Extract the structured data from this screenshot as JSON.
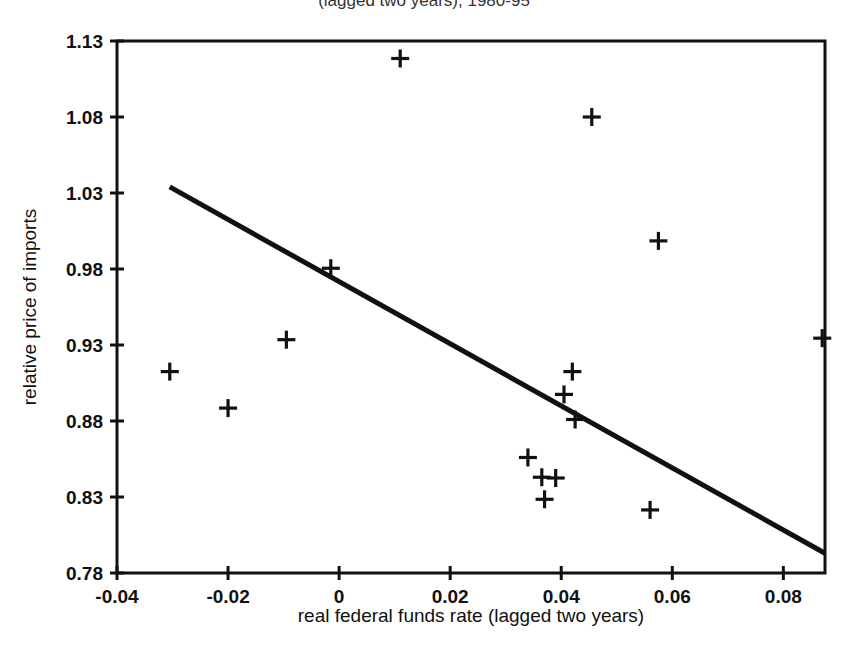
{
  "figure": {
    "clipped_title": "(lagged two years), 1980-95",
    "background_color": "#ffffff",
    "ink_color": "#111111"
  },
  "chart_data": {
    "type": "scatter",
    "title": "",
    "xlabel": "real federal funds rate (lagged two years)",
    "ylabel": "relative price of imports",
    "xlim": [
      -0.04,
      0.0875
    ],
    "ylim": [
      0.78,
      1.13
    ],
    "grid": false,
    "legend": null,
    "xticks": [
      -0.04,
      -0.02,
      0,
      0.02,
      0.04,
      0.06,
      0.08
    ],
    "xtick_labels": [
      "-0.04",
      "-0.02",
      "0",
      "0.02",
      "0.04",
      "0.06",
      "0.08"
    ],
    "yticks": [
      0.78,
      0.83,
      0.88,
      0.93,
      0.98,
      1.03,
      1.08,
      1.13
    ],
    "ytick_labels": [
      "0.78",
      "0.83",
      "0.88",
      "0.93",
      "0.98",
      "1.03",
      "1.08",
      "1.13"
    ],
    "marker": "plus",
    "points": [
      {
        "x": -0.0305,
        "y": 0.9125
      },
      {
        "x": -0.02,
        "y": 0.8885
      },
      {
        "x": -0.0095,
        "y": 0.9335
      },
      {
        "x": -0.0015,
        "y": 0.9805
      },
      {
        "x": 0.011,
        "y": 1.1185
      },
      {
        "x": 0.034,
        "y": 0.856
      },
      {
        "x": 0.0365,
        "y": 0.843
      },
      {
        "x": 0.039,
        "y": 0.8425
      },
      {
        "x": 0.037,
        "y": 0.8285
      },
      {
        "x": 0.042,
        "y": 0.9125
      },
      {
        "x": 0.0405,
        "y": 0.8975
      },
      {
        "x": 0.0425,
        "y": 0.881
      },
      {
        "x": 0.0455,
        "y": 1.08
      },
      {
        "x": 0.056,
        "y": 0.8215
      },
      {
        "x": 0.0575,
        "y": 0.9985
      },
      {
        "x": 0.087,
        "y": 0.9345
      }
    ],
    "fit_line": {
      "label": "regression line",
      "x_start": -0.0305,
      "y_start": 1.034,
      "x_end": 0.0875,
      "y_end": 0.793
    }
  }
}
